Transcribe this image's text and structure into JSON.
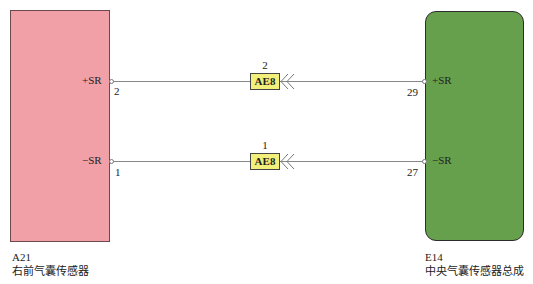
{
  "left_component": {
    "id": "A21",
    "name": "右前气囊传感器",
    "color": "#f1a0a8",
    "pins": [
      {
        "label": "+SR",
        "number": "2"
      },
      {
        "label": "−SR",
        "number": "1"
      }
    ]
  },
  "right_component": {
    "id": "E14",
    "name": "中央气囊传感器总成",
    "color": "#66a04c",
    "pins": [
      {
        "label": "+SR",
        "number": "29"
      },
      {
        "label": "−SR",
        "number": "27"
      }
    ]
  },
  "connectors": [
    {
      "code": "AE8",
      "pin": "2",
      "color": "#f2f07a"
    },
    {
      "code": "AE8",
      "pin": "1",
      "color": "#f2f07a"
    }
  ],
  "arrows": {
    "glyph": "<<"
  }
}
